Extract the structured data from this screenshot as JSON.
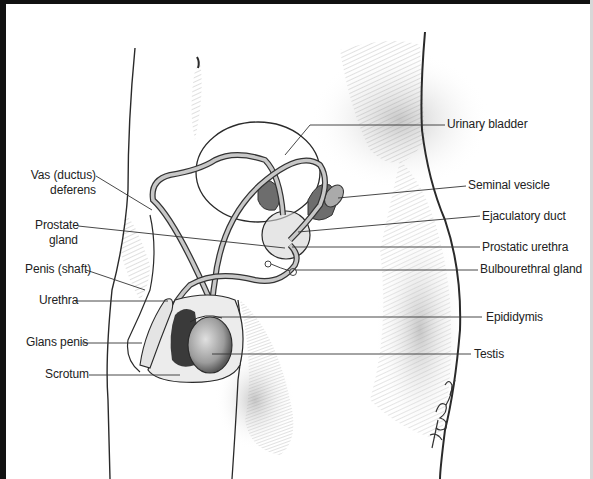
{
  "diagram": {
    "labels_left": [
      {
        "id": "vas-deferens",
        "line1": "Vas (ductus)",
        "line2": "deferens"
      },
      {
        "id": "prostate-gland",
        "line1": "Prostate",
        "line2": "gland"
      },
      {
        "id": "penis-shaft",
        "line1": "Penis (shaft)"
      },
      {
        "id": "urethra",
        "line1": "Urethra"
      },
      {
        "id": "glans-penis",
        "line1": "Glans penis"
      },
      {
        "id": "scrotum",
        "line1": "Scrotum"
      }
    ],
    "labels_right": [
      {
        "id": "urinary-bladder",
        "line1": "Urinary bladder"
      },
      {
        "id": "seminal-vesicle",
        "line1": "Seminal vesicle"
      },
      {
        "id": "ejaculatory-duct",
        "line1": "Ejaculatory duct"
      },
      {
        "id": "prostatic-urethra",
        "line1": "Prostatic urethra"
      },
      {
        "id": "bulbourethral-gland",
        "line1": "Bulbourethral gland"
      },
      {
        "id": "epididymis",
        "line1": "Epididymis"
      },
      {
        "id": "testis",
        "line1": "Testis"
      }
    ],
    "signature": "K. Born",
    "colors": {
      "ink": "#222222",
      "leader_line": "#333333",
      "shading": "#9a9a9a",
      "dark_tissue": "#3a3a3a",
      "border": "#111111"
    }
  }
}
